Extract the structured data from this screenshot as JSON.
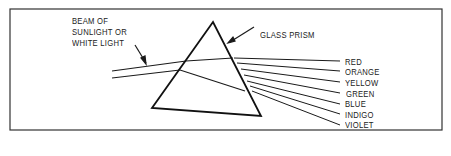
{
  "diagram": {
    "beam_label": [
      "BEAM OF",
      "SUNLIGHT OR",
      "WHITE LIGHT"
    ],
    "prism_label": "GLASS PRISM",
    "spectrum": [
      "RED",
      "ORANGE",
      "YELLOW",
      "GREEN",
      "BLUE",
      "INDIGO",
      "VIOLET"
    ],
    "line_color": "#1a1a1a"
  }
}
